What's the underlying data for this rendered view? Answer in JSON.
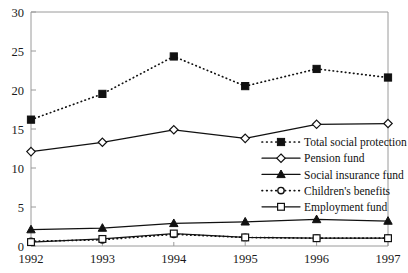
{
  "chart_data": {
    "type": "line",
    "title": "",
    "xlabel": "",
    "ylabel": "",
    "x": [
      "1992",
      "1993",
      "1994",
      "1995",
      "1996",
      "1997"
    ],
    "categories": [
      "1992",
      "1993",
      "1994",
      "1995",
      "1996",
      "1997"
    ],
    "xlim": [
      1992,
      1997
    ],
    "ylim": [
      0,
      30
    ],
    "yticks": [
      0,
      5,
      10,
      15,
      20,
      25,
      30
    ],
    "ytick_labels": [
      "0",
      "5",
      "10",
      "15",
      "20",
      "25",
      "30"
    ],
    "xtick_labels": [
      "1992",
      "1993",
      "1994",
      "1995",
      "1996",
      "1997"
    ],
    "grid": false,
    "legend_position": "center-right",
    "series": [
      {
        "name": "Total social protection",
        "marker": "filled-square",
        "line": "dotted",
        "values": [
          16.2,
          19.5,
          24.3,
          20.5,
          22.7,
          21.6
        ]
      },
      {
        "name": "Pension fund",
        "marker": "open-diamond",
        "line": "solid",
        "values": [
          12.1,
          13.3,
          14.9,
          13.8,
          15.6,
          15.7
        ]
      },
      {
        "name": "Social insurance fund",
        "marker": "filled-triangle",
        "line": "solid",
        "values": [
          2.1,
          2.3,
          2.9,
          3.1,
          3.4,
          3.2
        ]
      },
      {
        "name": "Children's benefits",
        "marker": "open-circle",
        "line": "dotted",
        "values": [
          0.6,
          0.8,
          1.5,
          1.1,
          1.0,
          1.0
        ]
      },
      {
        "name": "Employment fund",
        "marker": "open-square",
        "line": "solid",
        "values": [
          0.5,
          0.9,
          1.6,
          1.1,
          1.0,
          1.0
        ]
      }
    ],
    "colors": {
      "line": "#111111",
      "axis": "#9a9a9a",
      "text": "#1a1a1a",
      "background": "#ffffff"
    }
  },
  "legend": {
    "items": [
      {
        "label": "Total social protection"
      },
      {
        "label": "Pension fund"
      },
      {
        "label": "Social insurance fund"
      },
      {
        "label": "Children's benefits"
      },
      {
        "label": "Employment fund"
      }
    ]
  },
  "axes": {
    "y_tick_labels": [
      "30",
      "25",
      "20",
      "15",
      "10",
      "5",
      "0"
    ],
    "x_tick_labels": [
      "1992",
      "1993",
      "1994",
      "1995",
      "1996",
      "1997"
    ]
  }
}
